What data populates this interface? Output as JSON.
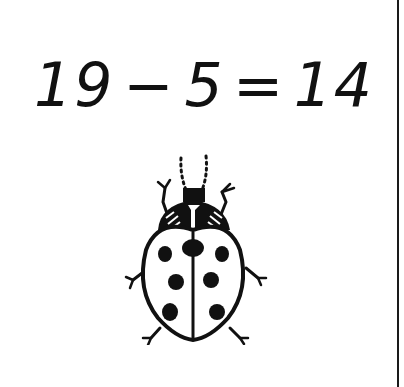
{
  "equation": {
    "operand_a": "19",
    "operator": "−",
    "operand_b": "5",
    "equals": "=",
    "result": "14"
  },
  "illustration": {
    "subject": "ladybug",
    "spot_count": 7,
    "colors": {
      "ink": "#111111",
      "paper": "#ffffff"
    }
  }
}
